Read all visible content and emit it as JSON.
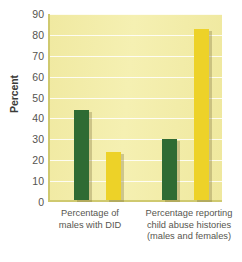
{
  "chart_data": {
    "type": "bar",
    "title": "",
    "xlabel": "",
    "ylabel": "Percent",
    "ylim": [
      0,
      90
    ],
    "ytick_step": 10,
    "yticks": [
      90,
      80,
      70,
      60,
      50,
      40,
      30,
      20,
      10,
      0
    ],
    "grid": true,
    "legend": "none",
    "categories": [
      "Percentage of males with DID",
      "Percentage reporting child abuse histories (males and females)"
    ],
    "category_lines": [
      [
        "Percentage of",
        "males with DID"
      ],
      [
        "Percentage reporting",
        "child abuse histories",
        "(males and females)"
      ]
    ],
    "series": [
      {
        "name": "green-series",
        "color": "#2f6b33",
        "values": [
          43,
          29
        ]
      },
      {
        "name": "yellow-series",
        "color": "#edd228",
        "values": [
          23,
          82
        ]
      }
    ],
    "bars": [
      {
        "group": 0,
        "series": 0,
        "value": 43,
        "color": "#2f6b33"
      },
      {
        "group": 0,
        "series": 1,
        "value": 23,
        "color": "#edd228"
      },
      {
        "group": 1,
        "series": 0,
        "value": 29,
        "color": "#2f6b33"
      },
      {
        "group": 1,
        "series": 1,
        "value": 82,
        "color": "#edd228"
      }
    ]
  },
  "colors": {
    "plot_background": "#f2eda8",
    "gridline": "#ffffff",
    "axis": "#cfc96f",
    "green_bar": "#2f6b33",
    "yellow_bar": "#edd228",
    "text": "#55544f",
    "page_background": "#ffffff"
  }
}
